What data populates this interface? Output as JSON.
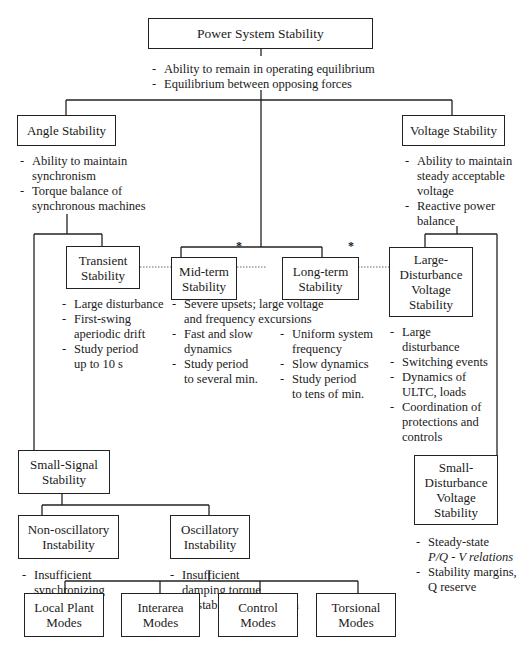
{
  "diagram": {
    "title": "Power System Stability",
    "root": {
      "label": "Power System Stability",
      "notes": [
        "Ability to remain in operating equilibrium",
        "Equilibrium between opposing forces"
      ]
    },
    "angle": {
      "label": "Angle Stability",
      "notes": [
        "Ability to maintain\nsynchronism",
        "Torque balance of\nsynchronous machines"
      ]
    },
    "voltage": {
      "label": "Voltage Stability",
      "notes": [
        "Ability to maintain\nsteady acceptable\nvoltage",
        "Reactive power\nbalance"
      ]
    },
    "transient": {
      "label": "Transient\nStability",
      "notes": [
        "Large disturbance",
        "First-swing\naperiodic drift",
        "Study period\nup to 10 s"
      ]
    },
    "midterm": {
      "label": "Mid-term\nStability",
      "marker": "*",
      "notes": [
        "Severe upsets; large voltage\nand frequency excursions",
        "Fast and slow\ndynamics",
        "Study period\nto several min."
      ]
    },
    "longterm": {
      "label": "Long-term\nStability",
      "marker": "*",
      "notes": [
        "Uniform system\nfrequency",
        "Slow dynamics",
        "Study period\nto tens of min."
      ]
    },
    "large_voltage": {
      "label": "Large-\nDisturbance\nVoltage\nStability",
      "notes": [
        "Large\ndisturbance",
        "Switching events",
        "Dynamics of\nULTC, loads",
        "Coordination of\nprotections and\ncontrols"
      ]
    },
    "small_signal": {
      "label": "Small-Signal\nStability"
    },
    "non_oscillatory": {
      "label": "Non-oscillatory\nInstability",
      "notes": [
        "Insufficient\nsynchronizing\ntorque"
      ]
    },
    "oscillatory": {
      "label": "Oscillatory\nInstability",
      "notes": [
        "Insufficient\ndamping torque",
        "Unstable control action"
      ]
    },
    "small_voltage": {
      "label": "Small-\nDisturbance\nVoltage\nStability",
      "notes": [
        "Steady-state",
        "P/Q - V relations",
        "Stability margins,",
        "Q reserve"
      ]
    },
    "modes": [
      {
        "label": "Local Plant\nModes"
      },
      {
        "label": "Interarea\nModes"
      },
      {
        "label": "Control\nModes"
      },
      {
        "label": "Torsional\nModes"
      }
    ],
    "colors": {
      "line": "#222222",
      "dotted_link": "#555555",
      "background": "#ffffff"
    }
  }
}
